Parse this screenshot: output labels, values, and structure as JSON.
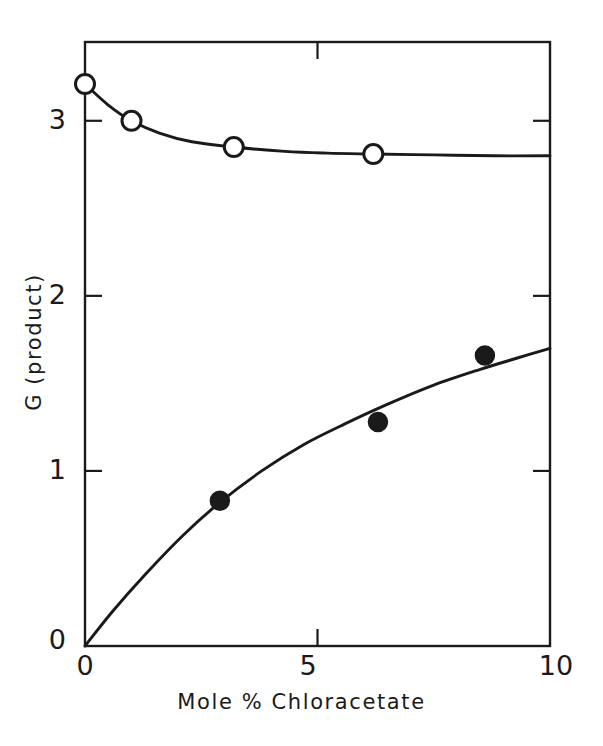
{
  "figure": {
    "background_color": "#ffffff",
    "ink_color": "#1a1a1a"
  },
  "axes": {
    "x_title": "Mole  %  Chloracetate",
    "y_title": "G (product)",
    "x_ticks": [
      {
        "value": 0,
        "label": "0"
      },
      {
        "value": 5,
        "label": "5"
      },
      {
        "value": 10,
        "label": "10"
      }
    ],
    "y_ticks": [
      {
        "value": 0,
        "label": "0"
      },
      {
        "value": 1,
        "label": "1"
      },
      {
        "value": 2,
        "label": "2"
      },
      {
        "value": 3,
        "label": "3"
      }
    ]
  },
  "chart_data": {
    "type": "scatter",
    "title": "",
    "subtitle": "",
    "xlabel": "Mole % Chloracetate",
    "ylabel": "G (product)",
    "xlim": [
      0,
      10
    ],
    "ylim": [
      0,
      3.45
    ],
    "xticks": [
      0,
      5,
      10
    ],
    "yticks": [
      0,
      1,
      2,
      3
    ],
    "grid": false,
    "legend": false,
    "legend_position": "none",
    "annotations": [],
    "series": [
      {
        "name": "open-circle-series",
        "marker": "open-circle",
        "marker_fill": "#ffffff",
        "marker_edge": "#1a1a1a",
        "line": "solid",
        "points": [
          {
            "x": 0.0,
            "y": 3.21
          },
          {
            "x": 1.0,
            "y": 3.0
          },
          {
            "x": 3.2,
            "y": 2.85
          },
          {
            "x": 6.2,
            "y": 2.81
          }
        ],
        "curve": [
          {
            "x": 0.0,
            "y": 3.21
          },
          {
            "x": 0.5,
            "y": 3.09
          },
          {
            "x": 1.0,
            "y": 3.0
          },
          {
            "x": 1.6,
            "y": 2.93
          },
          {
            "x": 2.3,
            "y": 2.88
          },
          {
            "x": 3.2,
            "y": 2.85
          },
          {
            "x": 4.3,
            "y": 2.825
          },
          {
            "x": 5.2,
            "y": 2.815
          },
          {
            "x": 6.2,
            "y": 2.81
          },
          {
            "x": 7.5,
            "y": 2.805
          },
          {
            "x": 8.8,
            "y": 2.8
          },
          {
            "x": 10.0,
            "y": 2.8
          }
        ]
      },
      {
        "name": "filled-circle-series",
        "marker": "filled-circle",
        "marker_fill": "#1a1a1a",
        "marker_edge": "#1a1a1a",
        "line": "solid",
        "points": [
          {
            "x": 2.9,
            "y": 0.83
          },
          {
            "x": 6.3,
            "y": 1.28
          },
          {
            "x": 8.6,
            "y": 1.66
          }
        ],
        "curve": [
          {
            "x": 0.0,
            "y": 0.0
          },
          {
            "x": 0.6,
            "y": 0.2
          },
          {
            "x": 1.3,
            "y": 0.41
          },
          {
            "x": 2.1,
            "y": 0.63
          },
          {
            "x": 2.9,
            "y": 0.82
          },
          {
            "x": 3.8,
            "y": 1.0
          },
          {
            "x": 4.7,
            "y": 1.15
          },
          {
            "x": 5.6,
            "y": 1.27
          },
          {
            "x": 6.5,
            "y": 1.38
          },
          {
            "x": 7.5,
            "y": 1.49
          },
          {
            "x": 8.5,
            "y": 1.58
          },
          {
            "x": 9.3,
            "y": 1.645
          },
          {
            "x": 10.0,
            "y": 1.7
          }
        ]
      }
    ]
  }
}
